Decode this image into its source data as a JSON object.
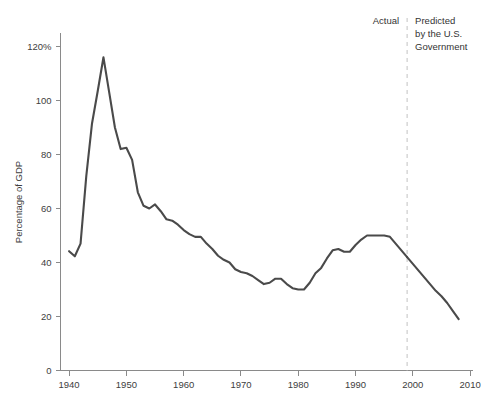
{
  "chart_data": {
    "type": "line",
    "title": "",
    "xlabel": "",
    "ylabel": "Percentage of GDP",
    "xlim": [
      1938.5,
      2010.5
    ],
    "ylim": [
      0,
      125
    ],
    "grid": false,
    "legend_position": "none",
    "x_ticks": [
      1940,
      1950,
      1960,
      1970,
      1980,
      1990,
      2000,
      2010
    ],
    "x_tick_labels": [
      "1940",
      "1950",
      "1960",
      "1970",
      "1980",
      "1990",
      "2000",
      "2010"
    ],
    "y_ticks": [
      0,
      20,
      40,
      60,
      80,
      100,
      120
    ],
    "y_tick_labels": [
      "0",
      "20",
      "40",
      "60",
      "80",
      "100",
      "120%"
    ],
    "series": [
      {
        "name": "Actual",
        "color": "#4a4a4a",
        "x": [
          1940,
          1941,
          1942,
          1943,
          1944,
          1945,
          1946,
          1947,
          1948,
          1949,
          1950,
          1951,
          1952,
          1953,
          1954,
          1955,
          1956,
          1957,
          1958,
          1959,
          1960,
          1961,
          1962,
          1963,
          1964,
          1965,
          1966,
          1967,
          1968,
          1969,
          1970,
          1971,
          1972,
          1973,
          1974,
          1975,
          1976,
          1977,
          1978,
          1979,
          1980,
          1981,
          1982,
          1983,
          1984,
          1985,
          1986,
          1987,
          1988,
          1989,
          1990,
          1991,
          1992,
          1993,
          1994,
          1995,
          1996,
          1997,
          1998,
          1999
        ],
        "values": [
          44.2,
          42.3,
          47.0,
          72.0,
          91.5,
          103.5,
          116.0,
          103.0,
          90.0,
          82.0,
          82.5,
          78.0,
          66.0,
          61.0,
          60.0,
          61.5,
          59.0,
          56.0,
          55.5,
          54.0,
          52.0,
          50.5,
          49.5,
          49.5,
          47.0,
          45.0,
          42.5,
          41.0,
          40.0,
          37.5,
          36.5,
          36.0,
          35.0,
          33.5,
          32.0,
          32.5,
          34.0,
          34.0,
          32.0,
          30.5,
          30.0,
          30.0,
          32.5,
          36.0,
          38.0,
          41.5,
          44.5,
          45.0,
          44.0,
          44.0,
          46.5,
          48.5,
          50.0,
          50.0,
          50.0,
          50.0,
          49.5,
          47.0,
          44.5,
          42.0
        ]
      },
      {
        "name": "Predicted by the U.S. Government",
        "color": "#4a4a4a",
        "x": [
          1999,
          2000,
          2001,
          2002,
          2003,
          2004,
          2005,
          2006,
          2007,
          2008
        ],
        "values": [
          42.0,
          39.5,
          37.0,
          34.5,
          32.0,
          29.5,
          27.5,
          25.0,
          22.0,
          19.0
        ]
      }
    ],
    "annotations": {
      "divider_x": 1999,
      "divider_color": "#c8c8c8",
      "actual_label": "Actual",
      "predicted_label_lines": [
        "Predicted",
        "by the U.S.",
        "Government"
      ]
    }
  },
  "axis": {
    "y_title": "Percentage of GDP",
    "axis_color": "#8a8a8a",
    "text_color": "#404040"
  }
}
